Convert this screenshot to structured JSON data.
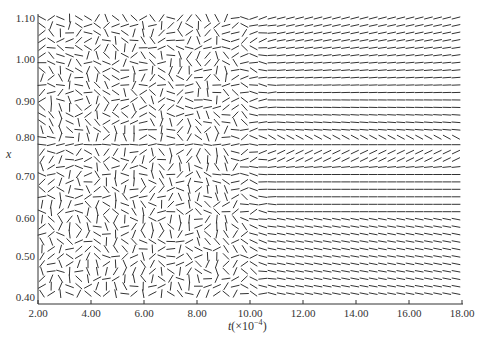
{
  "chart_data": {
    "type": "direction-field",
    "title": "",
    "xlabel": "t(×10⁻⁴)",
    "ylabel": "x",
    "xlim": [
      2.0,
      18.0
    ],
    "ylim": [
      0.38,
      1.1
    ],
    "x_ticks": [
      "2.00",
      "4.00",
      "6.00",
      "8.00",
      "10.00",
      "12.00",
      "14.00",
      "16.00",
      "18.00"
    ],
    "y_ticks": [
      "0.40",
      "0.50",
      "0.60",
      "0.70",
      "0.80",
      "0.90",
      "1.00",
      "1.10"
    ],
    "grid": false,
    "legend": null
  },
  "axes": {
    "x_label_main": "t",
    "x_label_paren": "(×10",
    "x_label_exp": "−4",
    "x_label_close": ")",
    "y_label": "x"
  }
}
